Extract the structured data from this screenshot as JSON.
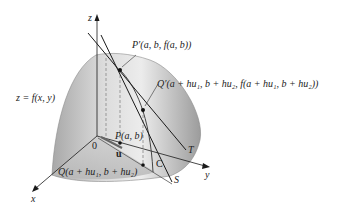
{
  "figure": {
    "axes": {
      "z": "z",
      "x": "x",
      "y": "y",
      "origin": "0"
    },
    "surface_label": "z = f(x, y)",
    "points": {
      "P_prime": "P′(a, b, f(a, b))",
      "Q_prime": "Q′(a + hu₁, b + hu₂, f(a + hu₁, b + hu₂))",
      "P": "P(a, b)",
      "Q": "Q(a + hu₁, b + hu₂)"
    },
    "vector_label": "u",
    "curve_label": "C",
    "lines": {
      "tangent": "T",
      "secant": "S"
    },
    "colors": {
      "surface_light": "#e6e6e6",
      "surface_dark": "#9a9a9a",
      "line": "#1a1a1a",
      "dashed": "#7a7a7a"
    }
  }
}
